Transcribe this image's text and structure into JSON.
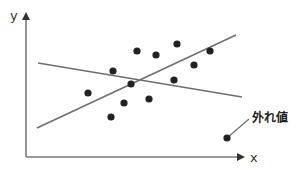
{
  "diagram": {
    "title": "",
    "axes": {
      "x_label": "x",
      "y_label": "y",
      "color": "#7a7a7a"
    },
    "colors": {
      "line": "#6e6e6e",
      "point": "#222222",
      "text": "#333333"
    },
    "points": [
      {
        "x": 88,
        "y": 93
      },
      {
        "x": 113,
        "y": 71
      },
      {
        "x": 137,
        "y": 51
      },
      {
        "x": 156,
        "y": 55
      },
      {
        "x": 177,
        "y": 44
      },
      {
        "x": 210,
        "y": 51
      },
      {
        "x": 194,
        "y": 65
      },
      {
        "x": 174,
        "y": 80
      },
      {
        "x": 131,
        "y": 84
      },
      {
        "x": 149,
        "y": 99
      },
      {
        "x": 124,
        "y": 103
      },
      {
        "x": 111,
        "y": 117
      }
    ],
    "outlier": {
      "x": 227,
      "y": 138,
      "label": "外れ値"
    },
    "lines": [
      {
        "name": "regression-with-outlier",
        "x1": 38,
        "y1": 63,
        "x2": 242,
        "y2": 97
      },
      {
        "name": "regression-without-outlier",
        "x1": 37,
        "y1": 128,
        "x2": 236,
        "y2": 35
      }
    ]
  }
}
